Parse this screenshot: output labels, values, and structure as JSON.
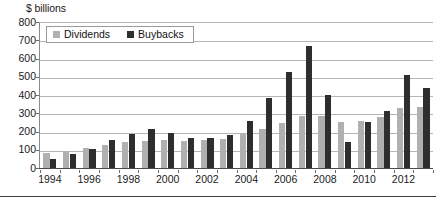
{
  "chart_data": {
    "type": "bar",
    "title": "",
    "ylabel": "$ billions",
    "xlabel": "",
    "ylim": [
      0,
      800
    ],
    "ytick_step": 100,
    "yticks": [
      0,
      100,
      200,
      300,
      400,
      500,
      600,
      700,
      800
    ],
    "grid": true,
    "legend_position": "top-left",
    "categories": [
      "1994",
      "1995",
      "1996",
      "1997",
      "1998",
      "1999",
      "2000",
      "2001",
      "2002",
      "2003",
      "2004",
      "2005",
      "2006",
      "2007",
      "2008",
      "2009",
      "2010",
      "2011",
      "2012",
      "2013"
    ],
    "visible_tick_labels": [
      "1994",
      "1996",
      "1998",
      "2000",
      "2002",
      "2004",
      "2006",
      "2008",
      "2010",
      "2012"
    ],
    "series": [
      {
        "name": "Dividends",
        "color": "#b0b0b0",
        "values": [
          80,
          95,
          110,
          125,
          140,
          150,
          155,
          150,
          155,
          160,
          185,
          215,
          245,
          285,
          285,
          250,
          260,
          280,
          330,
          335
        ]
      },
      {
        "name": "Buybacks",
        "color": "#2e2e2e",
        "values": [
          50,
          75,
          105,
          155,
          185,
          215,
          190,
          165,
          165,
          180,
          255,
          385,
          525,
          670,
          400,
          145,
          250,
          310,
          510,
          440
        ]
      }
    ]
  },
  "legend": {
    "items": [
      {
        "label": "Dividends",
        "swatch": "#b0b0b0"
      },
      {
        "label": "Buybacks",
        "swatch": "#2e2e2e"
      }
    ]
  },
  "axis": {
    "y_title": "$ billions"
  },
  "colors": {
    "dividends": "#b0b0b0",
    "buybacks": "#2e2e2e",
    "gridline": "#b5b5b5",
    "baseline": "#4a4a4a",
    "text": "#1a1a1a"
  }
}
